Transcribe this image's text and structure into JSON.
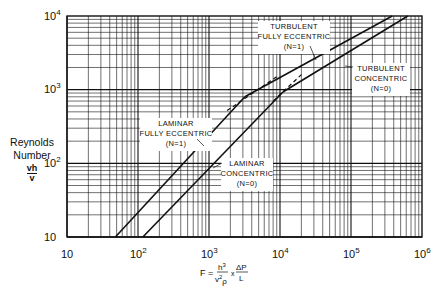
{
  "chart_data": {
    "type": "line",
    "scale": "log-log",
    "title": "",
    "xlabel": "F = h^3/(v^2 ρ) × ΔP/L",
    "ylabel": "Reynolds Number vh/v",
    "xlim": [
      10,
      1000000
    ],
    "ylim": [
      10,
      10000
    ],
    "grid": true,
    "x_ticks": [
      "10",
      "10^2",
      "10^3",
      "10^4",
      "10^5",
      "10^6"
    ],
    "y_ticks": [
      "10",
      "10^2",
      "10^3",
      "10^4"
    ],
    "series": [
      {
        "name": "Laminar Fully Eccentric (N=1)",
        "x": [
          48,
          3200
        ],
        "y": [
          10,
          800
        ]
      },
      {
        "name": "Turbulent Fully Eccentric (N=1)",
        "x": [
          3200,
          380000
        ],
        "y": [
          800,
          10000
        ]
      },
      {
        "name": "Laminar Concentric (N=0)",
        "x": [
          117,
          11000
        ],
        "y": [
          10,
          930
        ]
      },
      {
        "name": "Turbulent Concentric (N=0)",
        "x": [
          11000,
          630000
        ],
        "y": [
          930,
          10000
        ]
      }
    ],
    "annotations": [
      {
        "text": [
          "TURBULENT",
          "FULLY ECCENTRIC",
          "(N=1)"
        ]
      },
      {
        "text": [
          "TURBULENT",
          "CONCENTRIC",
          "(N=0)"
        ]
      },
      {
        "text": [
          "LAMINAR",
          "FULLY ECCENTRIC",
          "(N=1)"
        ]
      },
      {
        "text": [
          "LAMINAR",
          "CONCENTRIC",
          "(N=0)"
        ]
      }
    ]
  },
  "labels": {
    "y_axis_line1": "Reynolds",
    "y_axis_line2": "Number",
    "y_axis_num": "vh",
    "y_axis_den": "v",
    "x_ticks": [
      "10",
      "10",
      "10",
      "10",
      "10",
      "10"
    ],
    "x_exps": [
      "",
      "2",
      "3",
      "4",
      "5",
      "6"
    ],
    "y_ticks": [
      "10",
      "10",
      "10",
      "10"
    ],
    "y_exps": [
      "",
      "2",
      "3",
      "4"
    ],
    "formula_F": "F =",
    "formula_h": "h",
    "formula_h_exp": "3",
    "formula_den": "v",
    "formula_den_exp": "2",
    "formula_rho": "ρ",
    "formula_times": "x",
    "formula_dp": "ΔP",
    "formula_L": "L",
    "ann_te": [
      "TURBULENT",
      "FULLY ECCENTRIC",
      "(N=1)"
    ],
    "ann_tc": [
      "TURBULENT",
      "CONCENTRIC",
      "(N=0)"
    ],
    "ann_le": [
      "LAMINAR",
      "FULLY ECCENTRIC",
      "(N=1)"
    ],
    "ann_lc": [
      "LAMINAR",
      "CONCENTRIC",
      "(N=0)"
    ]
  }
}
